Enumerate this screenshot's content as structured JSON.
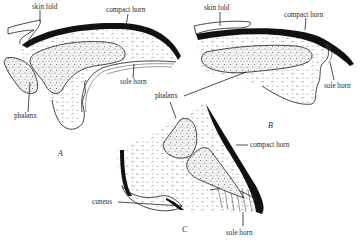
{
  "figure": {
    "panels": [
      {
        "id": "A",
        "label": "A",
        "annotations": {
          "skin_fold": "skin fold",
          "compact_horn": "compact horn",
          "sole_horn": "sole horn",
          "phalanx": "phalanx"
        }
      },
      {
        "id": "B",
        "label": "B",
        "annotations": {
          "skin_fold": "skin fold",
          "compact_horn": "compact horn",
          "sole_horn": "sole horn"
        }
      },
      {
        "id": "C",
        "label": "C",
        "annotations": {
          "compact_horn": "compact horn",
          "cuneus": "cuneus",
          "sole_horn": "sole horn"
        }
      }
    ],
    "shared_annotations": {
      "phalanx": "phalanx"
    }
  }
}
